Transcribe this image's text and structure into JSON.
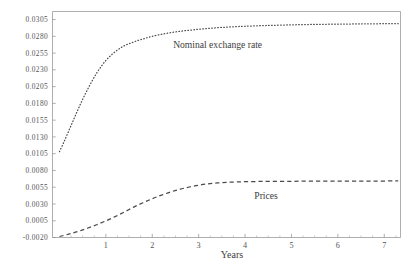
{
  "chart_data": {
    "type": "line",
    "title": "",
    "xlabel": "Years",
    "ylabel": "",
    "xlim": [
      -0.15,
      7.35
    ],
    "ylim": [
      -0.002,
      0.0317
    ],
    "grid": false,
    "legend_position": "inline-annotation",
    "xticks": [
      1,
      2,
      3,
      4,
      5,
      6,
      7
    ],
    "xtick_labels": [
      "1",
      "2",
      "3",
      "4",
      "5",
      "6",
      "7"
    ],
    "xminor_ticks": [
      0.25,
      0.5,
      0.75,
      1.25,
      1.5,
      1.75,
      2.25,
      2.5,
      2.75,
      3.25,
      3.5,
      3.75,
      4.25,
      4.5,
      4.75,
      5.25,
      5.5,
      5.75,
      6.25,
      6.5,
      6.75,
      7.25
    ],
    "yticks": [
      -0.002,
      0.0005,
      0.003,
      0.0055,
      0.008,
      0.0105,
      0.013,
      0.0155,
      0.018,
      0.0205,
      0.023,
      0.0255,
      0.028,
      0.0305
    ],
    "ytick_labels": [
      "-0.0020",
      "0.0005",
      "0.0030",
      "0.0055",
      "0.0080",
      "0.0105",
      "0.0130",
      "0.0155",
      "0.0180",
      "0.0205",
      "0.0230",
      "0.0255",
      "0.0280",
      "0.0305"
    ],
    "series": [
      {
        "name": "Nominal exchange rate",
        "style": "dotted",
        "color": "#4a4a4a",
        "annotation": "Nominal exchange rate",
        "annotation_x": 2.45,
        "annotation_y": 0.0262,
        "x": [
          0.0,
          0.1,
          0.2,
          0.3,
          0.4,
          0.5,
          0.6,
          0.7,
          0.8,
          0.9,
          1.0,
          1.1,
          1.2,
          1.3,
          1.4,
          1.5,
          1.6,
          1.7,
          1.8,
          1.9,
          2.0,
          2.2,
          2.4,
          2.6,
          2.8,
          3.0,
          3.2,
          3.4,
          3.6,
          3.8,
          4.0,
          4.3,
          4.6,
          5.0,
          5.4,
          5.8,
          6.2,
          6.6,
          7.0,
          7.3
        ],
        "y": [
          0.0108,
          0.0123,
          0.0139,
          0.0155,
          0.0171,
          0.0186,
          0.02,
          0.0213,
          0.0225,
          0.0235,
          0.0244,
          0.0251,
          0.0257,
          0.0262,
          0.0266,
          0.0269,
          0.02715,
          0.0274,
          0.0276,
          0.0278,
          0.028,
          0.0283,
          0.02855,
          0.02875,
          0.0289,
          0.02905,
          0.02918,
          0.02928,
          0.02937,
          0.02944,
          0.0295,
          0.02958,
          0.02964,
          0.02971,
          0.02976,
          0.0298,
          0.02983,
          0.02986,
          0.02988,
          0.02989
        ]
      },
      {
        "name": "Prices",
        "style": "dashed",
        "color": "#4a4a4a",
        "annotation": "Prices",
        "annotation_x": 4.2,
        "annotation_y": 0.0038,
        "x": [
          0.0,
          0.2,
          0.4,
          0.6,
          0.8,
          1.0,
          1.2,
          1.4,
          1.6,
          1.8,
          2.0,
          2.2,
          2.4,
          2.6,
          2.8,
          3.0,
          3.2,
          3.4,
          3.6,
          3.8,
          4.0,
          4.4,
          4.8,
          5.2,
          5.6,
          6.0,
          6.4,
          6.8,
          7.2,
          7.3
        ],
        "y": [
          -0.00185,
          -0.0015,
          -0.0011,
          -0.00062,
          -0.0001,
          0.00048,
          0.00112,
          0.0018,
          0.00253,
          0.00318,
          0.00378,
          0.00432,
          0.0048,
          0.0052,
          0.00553,
          0.0058,
          0.006,
          0.00613,
          0.00622,
          0.00628,
          0.00632,
          0.00636,
          0.00638,
          0.00639,
          0.0064,
          0.00641,
          0.00642,
          0.00642,
          0.00643,
          0.00643
        ]
      }
    ]
  }
}
